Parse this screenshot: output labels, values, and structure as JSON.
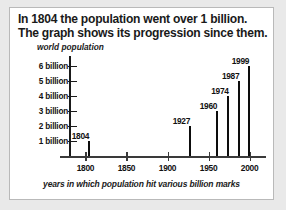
{
  "title": {
    "line1": "In 1804 the population went over 1 billion.",
    "line2": "The graph shows its progression since them."
  },
  "chart_data": {
    "type": "bar",
    "title": "",
    "ylabel": "world population",
    "xlabel": "years in which population hit various billion marks",
    "x": [
      1804,
      1927,
      1960,
      1974,
      1987,
      1999
    ],
    "values": [
      1,
      2,
      3,
      4,
      5,
      6
    ],
    "bar_labels": [
      "1804",
      "1927",
      "1960",
      "1974",
      "1987",
      "1999"
    ],
    "xlim": [
      1780,
      2020
    ],
    "ylim": [
      0,
      6.5
    ],
    "xticks": [
      1800,
      1850,
      1900,
      1950,
      2000
    ],
    "xtick_labels": [
      "1800",
      "1850",
      "1900",
      "1950",
      "2000"
    ],
    "yticks": [
      1,
      2,
      3,
      4,
      5,
      6
    ],
    "ytick_labels": [
      "1 billion",
      "2 billion",
      "3 billion",
      "4 billion",
      "5 billion",
      "6 billion"
    ],
    "grid": false,
    "legend": null,
    "bar_color": "#0d0d0d",
    "axis_color": "#1a1a1a"
  }
}
